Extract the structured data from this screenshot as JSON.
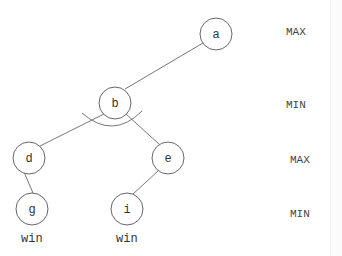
{
  "diagram": {
    "type": "game-tree",
    "nodes": [
      {
        "id": "a",
        "label": "a",
        "x": 216,
        "y": 34
      },
      {
        "id": "b",
        "label": "b",
        "x": 115,
        "y": 103
      },
      {
        "id": "d",
        "label": "d",
        "x": 29,
        "y": 158
      },
      {
        "id": "e",
        "label": "e",
        "x": 168,
        "y": 158
      },
      {
        "id": "g",
        "label": "g",
        "x": 32,
        "y": 209
      },
      {
        "id": "i",
        "label": "i",
        "x": 127,
        "y": 209
      }
    ],
    "edges": [
      [
        "a",
        "b"
      ],
      [
        "b",
        "d"
      ],
      [
        "b",
        "e"
      ],
      [
        "d",
        "g"
      ],
      [
        "e",
        "i"
      ]
    ],
    "levels": [
      {
        "label": "MAX",
        "y": 34
      },
      {
        "label": "MIN",
        "y": 106
      },
      {
        "label": "MAX",
        "y": 161
      },
      {
        "label": "MIN",
        "y": 215
      }
    ],
    "leaf_values": [
      {
        "node": "g",
        "value": "win"
      },
      {
        "node": "i",
        "value": "win"
      }
    ],
    "and_arc_node": "b"
  }
}
